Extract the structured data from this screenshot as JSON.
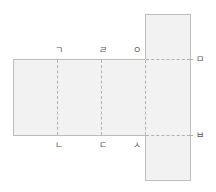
{
  "diagram": {
    "type": "net-of-rectangular-prism",
    "fill_color": "#f2f2f2",
    "edge_color": "#bdbdbd",
    "fold_line_color": "#b0b0b0",
    "labels": {
      "top": [
        "ㄱ",
        "ㄹ",
        "ㅇ"
      ],
      "bottom": [
        "ㄴ",
        "ㄷ",
        "ㅅ"
      ],
      "right": [
        "ㅁ",
        "ㅂ"
      ]
    }
  }
}
